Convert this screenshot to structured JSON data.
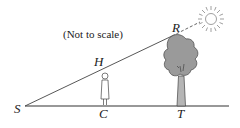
{
  "diagram": {
    "note": "(Not to scale)",
    "points": {
      "S": "S",
      "H": "H",
      "C": "C",
      "R": "R",
      "T": "T"
    },
    "objects": [
      "sun",
      "tree",
      "person",
      "ground line",
      "sun ray line"
    ]
  }
}
